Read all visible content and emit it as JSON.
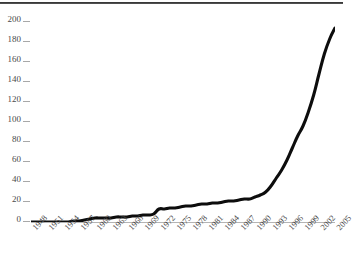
{
  "chart_data": {
    "type": "line",
    "title": "",
    "xlabel": "",
    "ylabel": "",
    "xlim": [
      1948,
      2005
    ],
    "ylim": [
      0,
      200
    ],
    "grid": false,
    "legend": null,
    "y_ticks": [
      0,
      20,
      40,
      60,
      80,
      100,
      120,
      140,
      160,
      180,
      200
    ],
    "x_tick_labels": [
      "1948",
      "1951",
      "1954",
      "1957",
      "1960",
      "1963",
      "1966",
      "1969",
      "1972",
      "1975",
      "1978",
      "1981",
      "1984",
      "1987",
      "1990",
      "1993",
      "1996",
      "1999",
      "2002",
      "2005"
    ],
    "x_tick_step_years": 3,
    "line_color": "#0d0d0d",
    "axis_color": "#b4b4b4",
    "series": [
      {
        "name": "cumulative total",
        "x": [
          1948,
          1949,
          1950,
          1951,
          1952,
          1953,
          1954,
          1955,
          1956,
          1957,
          1958,
          1959,
          1960,
          1961,
          1962,
          1963,
          1964,
          1965,
          1966,
          1967,
          1968,
          1969,
          1970,
          1971,
          1972,
          1973,
          1974,
          1975,
          1976,
          1977,
          1978,
          1979,
          1980,
          1981,
          1982,
          1983,
          1984,
          1985,
          1986,
          1987,
          1988,
          1989,
          1990,
          1991,
          1992,
          1993,
          1994,
          1995,
          1996,
          1997,
          1998,
          1999,
          2000,
          2001,
          2002,
          2003,
          2004,
          2005
        ],
        "values": [
          0,
          0,
          0,
          0,
          0,
          0,
          0,
          0,
          1,
          1,
          2,
          3,
          4,
          4,
          4,
          4,
          5,
          5,
          5,
          6,
          6,
          7,
          7,
          8,
          13,
          13,
          14,
          14,
          15,
          16,
          16,
          17,
          18,
          18,
          19,
          19,
          20,
          21,
          21,
          22,
          23,
          23,
          25,
          27,
          30,
          36,
          44,
          52,
          62,
          74,
          86,
          96,
          110,
          127,
          148,
          168,
          183,
          194
        ]
      }
    ]
  }
}
